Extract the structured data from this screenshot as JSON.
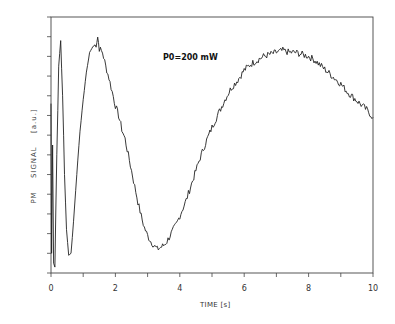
{
  "chart_data": {
    "type": "line",
    "title": "",
    "xlabel": "TIME  [s]",
    "ylabel": "PM   SIGNAL   [a.u.]",
    "annotation": "P0=200 mW",
    "xlim": [
      0,
      10
    ],
    "ylim": [
      0,
      13
    ],
    "x_ticks": [
      0,
      2,
      4,
      6,
      8,
      10
    ],
    "x_minor_ticks": [
      1,
      3,
      5,
      7,
      9
    ],
    "y_tick_labels": [],
    "grid": false,
    "legend": null,
    "series": [
      {
        "name": "PM signal",
        "x": [
          0.0,
          0.02,
          0.05,
          0.08,
          0.12,
          0.18,
          0.24,
          0.3,
          0.36,
          0.42,
          0.48,
          0.55,
          0.62,
          0.7,
          0.8,
          0.9,
          1.0,
          1.1,
          1.2,
          1.3,
          1.4,
          1.45,
          1.5,
          1.6,
          1.7,
          1.8,
          1.9,
          2.0,
          2.1,
          2.2,
          2.3,
          2.4,
          2.5,
          2.6,
          2.7,
          2.8,
          2.9,
          3.0,
          3.1,
          3.2,
          3.3,
          3.4,
          3.5,
          3.6,
          3.7,
          3.8,
          3.9,
          4.0,
          4.2,
          4.4,
          4.6,
          4.8,
          5.0,
          5.2,
          5.4,
          5.6,
          5.8,
          6.0,
          6.2,
          6.4,
          6.6,
          6.8,
          7.0,
          7.2,
          7.4,
          7.6,
          7.8,
          8.0,
          8.2,
          8.4,
          8.6,
          8.8,
          9.0,
          9.2,
          9.4,
          9.6,
          9.8,
          10.0
        ],
        "y": [
          8.6,
          1.0,
          6.5,
          0.5,
          0.3,
          6.0,
          10.5,
          11.8,
          9.0,
          5.0,
          2.2,
          0.9,
          1.0,
          2.6,
          5.0,
          7.2,
          8.8,
          10.2,
          11.2,
          11.5,
          11.6,
          12.0,
          11.4,
          11.2,
          10.5,
          9.9,
          9.2,
          8.5,
          8.0,
          7.3,
          6.8,
          6.0,
          5.2,
          4.4,
          3.6,
          2.9,
          2.3,
          1.9,
          1.6,
          1.4,
          1.2,
          1.3,
          1.4,
          1.6,
          1.9,
          2.2,
          2.5,
          2.9,
          3.7,
          4.7,
          5.7,
          6.6,
          7.4,
          8.1,
          8.8,
          9.4,
          9.8,
          10.3,
          10.6,
          10.8,
          11.0,
          11.1,
          11.2,
          11.3,
          11.2,
          11.2,
          11.1,
          11.0,
          10.8,
          10.5,
          10.2,
          9.9,
          9.6,
          9.2,
          8.9,
          8.6,
          8.3,
          7.9
        ]
      }
    ]
  }
}
